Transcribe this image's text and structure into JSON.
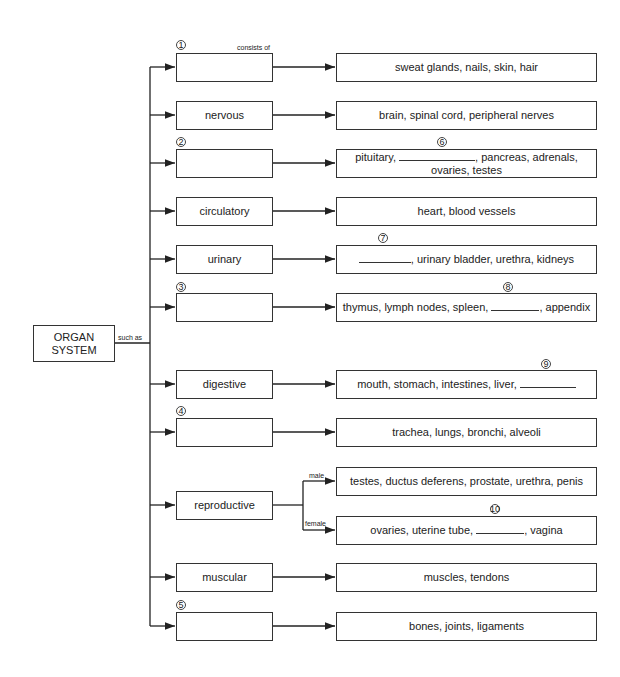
{
  "root": {
    "line1": "ORGAN",
    "line2": "SYSTEM",
    "connector_label": "such as"
  },
  "consists_label": "consists of",
  "rows": [
    {
      "num": "1",
      "system": "",
      "parts": "sweat glands, nails, skin, hair"
    },
    {
      "num": "",
      "system": "nervous",
      "parts": "brain, spinal cord, peripheral nerves"
    },
    {
      "num": "2",
      "system": "",
      "parts_pre": "pituitary,",
      "blank_num": "6",
      "parts_post": ", pancreas, adrenals,",
      "parts_line2": "ovaries, testes"
    },
    {
      "num": "",
      "system": "circulatory",
      "parts": "heart, blood vessels"
    },
    {
      "num": "",
      "system": "urinary",
      "blank_num": "7",
      "parts_post": ", urinary bladder, urethra, kidneys"
    },
    {
      "num": "3",
      "system": "",
      "parts_pre": "thymus, lymph nodes, spleen,",
      "blank_num": "8",
      "parts_post": ", appendix"
    },
    {
      "num": "",
      "system": "digestive",
      "parts_pre": "mouth, stomach, intestines, liver,",
      "blank_num": "9"
    },
    {
      "num": "4",
      "system": "",
      "parts": "trachea, lungs, bronchi, alveoli"
    },
    {
      "num": "",
      "system": "reproductive",
      "male_label": "male",
      "male_parts": "testes, ductus deferens, prostate, urethra, penis",
      "female_label": "female",
      "female_pre": "ovaries, uterine tube,",
      "blank_num": "10",
      "female_post": ", vagina"
    },
    {
      "num": "",
      "system": "muscular",
      "parts": "muscles, tendons"
    },
    {
      "num": "5",
      "system": "",
      "parts": "bones, joints, ligaments"
    }
  ]
}
